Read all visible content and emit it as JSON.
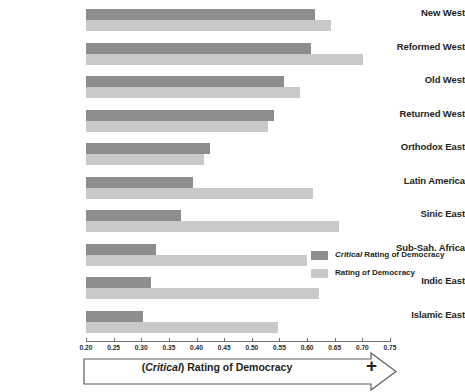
{
  "chart_data": {
    "type": "bar",
    "orientation": "horizontal",
    "title": "",
    "xlabel": "(Critical) Rating of Democracy",
    "ylabel": "",
    "xlim": [
      0.2,
      0.75
    ],
    "xticks": [
      "0.20",
      "0.25",
      "0.30",
      "0.35",
      "0.40",
      "0.45",
      "0.50",
      "0.55",
      "0.60",
      "0.65",
      "0.70",
      "0.75"
    ],
    "grid": false,
    "legend_position": "right-middle",
    "categories": [
      "New West",
      "Reformed West",
      "Old West",
      "Returned West",
      "Orthodox East",
      "Latin America",
      "Sinic East",
      "Sub-Sah. Africa",
      "Indic East",
      "Islamic East"
    ],
    "series": [
      {
        "name": "Critical Rating of Democracy",
        "color": "#8d8d8d",
        "values": [
          0.614,
          0.607,
          0.559,
          0.541,
          0.425,
          0.394,
          0.372,
          0.326,
          0.317,
          0.303
        ]
      },
      {
        "name": "Rating of Democracy",
        "color": "#c9c9c9",
        "values": [
          0.643,
          0.702,
          0.587,
          0.53,
          0.413,
          0.61,
          0.658,
          0.599,
          0.621,
          0.548
        ]
      }
    ]
  },
  "legend": {
    "items": [
      {
        "label_italic": "Critical",
        "label_rest": " Rating of Democracy",
        "color": "#8d8d8d"
      },
      {
        "label_italic": "",
        "label_rest": "Rating of Democracy",
        "color": "#c9c9c9"
      }
    ]
  },
  "axis_banner": {
    "prefix": "(",
    "italic": "Critical",
    "suffix": ") Rating of Democracy",
    "plus_sign": "+"
  }
}
